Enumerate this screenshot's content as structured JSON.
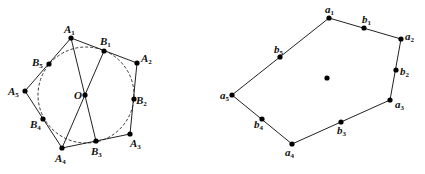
{
  "left_figure": {
    "polygon_vertices": [
      {
        "name": "A",
        "sub": "1",
        "x": 71,
        "y": 38,
        "lx": 64,
        "ly": 33
      },
      {
        "name": "A",
        "sub": "2",
        "x": 137,
        "y": 63,
        "lx": 141,
        "ly": 62
      },
      {
        "name": "A",
        "sub": "3",
        "x": 130,
        "y": 134,
        "lx": 130,
        "ly": 147
      },
      {
        "name": "A",
        "sub": "4",
        "x": 62,
        "y": 148,
        "lx": 55,
        "ly": 162
      },
      {
        "name": "A",
        "sub": "5",
        "x": 25,
        "y": 91,
        "lx": 8,
        "ly": 95
      }
    ],
    "tangent_points": [
      {
        "name": "B",
        "sub": "1",
        "x": 104,
        "y": 51,
        "lx": 100,
        "ly": 45
      },
      {
        "name": "B",
        "sub": "2",
        "x": 134,
        "y": 99,
        "lx": 136,
        "ly": 104
      },
      {
        "name": "B",
        "sub": "3",
        "x": 96,
        "y": 141,
        "lx": 91,
        "ly": 155
      },
      {
        "name": "B",
        "sub": "4",
        "x": 43,
        "y": 119,
        "lx": 30,
        "ly": 128
      },
      {
        "name": "B",
        "sub": "5",
        "x": 49,
        "y": 64,
        "lx": 32,
        "ly": 66
      }
    ],
    "center": {
      "name": "O",
      "x": 85,
      "y": 95,
      "lx": 74,
      "ly": 99
    },
    "incircle": {
      "cx": 86,
      "cy": 95,
      "r": 48
    },
    "chords": [
      [
        "A1",
        "B3"
      ],
      [
        "A4",
        "B1"
      ]
    ]
  },
  "right_figure": {
    "polygon_vertices": [
      {
        "name": "a",
        "sub": "1",
        "x": 329,
        "y": 18,
        "lx": 325,
        "ly": 13
      },
      {
        "name": "a",
        "sub": "2",
        "x": 401,
        "y": 39,
        "lx": 405,
        "ly": 40
      },
      {
        "name": "a",
        "sub": "3",
        "x": 390,
        "y": 100,
        "lx": 395,
        "ly": 108
      },
      {
        "name": "a",
        "sub": "4",
        "x": 292,
        "y": 144,
        "lx": 285,
        "ly": 156
      },
      {
        "name": "a",
        "sub": "5",
        "x": 232,
        "y": 95,
        "lx": 220,
        "ly": 99
      }
    ],
    "midpoints": [
      {
        "name": "b",
        "sub": "1",
        "x": 364,
        "y": 28,
        "lx": 362,
        "ly": 23
      },
      {
        "name": "b",
        "sub": "2",
        "x": 396,
        "y": 70,
        "lx": 400,
        "ly": 75
      },
      {
        "name": "b",
        "sub": "3",
        "x": 341,
        "y": 122,
        "lx": 337,
        "ly": 134
      },
      {
        "name": "b",
        "sub": "4",
        "x": 262,
        "y": 119,
        "lx": 254,
        "ly": 128
      },
      {
        "name": "b",
        "sub": "5",
        "x": 280,
        "y": 57,
        "lx": 274,
        "ly": 53
      }
    ],
    "center_point": {
      "x": 327,
      "y": 78
    }
  }
}
